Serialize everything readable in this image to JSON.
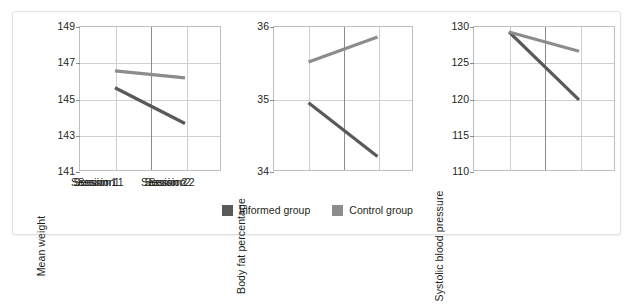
{
  "figure": {
    "background": "#ffffff",
    "border_color": "#e2e2e2"
  },
  "legend": {
    "position": "bottom-center",
    "items": [
      {
        "label": "Informed group",
        "color": "#595959"
      },
      {
        "label": "Control group",
        "color": "#8c8c8c"
      }
    ]
  },
  "chart_data": [
    {
      "type": "line",
      "title": "",
      "xlabel": "",
      "ylabel": "Mean weight",
      "categories": [
        "Session 1",
        "Session 2"
      ],
      "yticks": [
        149,
        147,
        145,
        143,
        141
      ],
      "ylim": [
        141,
        149
      ],
      "grid": true,
      "series": [
        {
          "name": "Informed group",
          "color": "#595959",
          "values": [
            145.6,
            143.6
          ]
        },
        {
          "name": "Control group",
          "color": "#8c8c8c",
          "values": [
            146.55,
            146.15
          ]
        }
      ]
    },
    {
      "type": "line",
      "title": "",
      "xlabel": "",
      "ylabel": "Body fat percentage",
      "categories": [
        "Session 1",
        "Session 2"
      ],
      "yticks": [
        36,
        35,
        34
      ],
      "ylim": [
        34,
        36
      ],
      "grid": true,
      "series": [
        {
          "name": "Informed group",
          "color": "#595959",
          "values": [
            34.94,
            34.19
          ]
        },
        {
          "name": "Control group",
          "color": "#8c8c8c",
          "values": [
            35.51,
            35.86
          ]
        }
      ]
    },
    {
      "type": "line",
      "title": "",
      "xlabel": "",
      "ylabel": "Systolic blood pressure",
      "categories": [
        "Session 1",
        "Session 2"
      ],
      "yticks": [
        130,
        125,
        120,
        115,
        110
      ],
      "ylim": [
        110,
        130
      ],
      "grid": true,
      "series": [
        {
          "name": "Informed group",
          "color": "#595959",
          "values": [
            129.3,
            119.8
          ]
        },
        {
          "name": "Control group",
          "color": "#8c8c8c",
          "values": [
            129.3,
            126.6
          ]
        }
      ]
    }
  ]
}
